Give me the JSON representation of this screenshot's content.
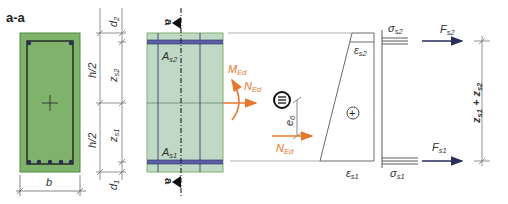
{
  "section_label": "a-a",
  "section_mark": "a",
  "labels": {
    "b": "b",
    "d1": {
      "main": "d",
      "sub": "1"
    },
    "d2": {
      "main": "d",
      "sub": "2"
    },
    "h_half": "h/2",
    "zs1": {
      "main": "z",
      "sub": "s1"
    },
    "zs2": {
      "main": "z",
      "sub": "s2"
    },
    "As1": {
      "main": "A",
      "sub": "s1"
    },
    "As2": {
      "main": "A",
      "sub": "s2"
    },
    "MEd": {
      "main": "M",
      "sub": "Ed"
    },
    "NEd": {
      "main": "N",
      "sub": "Ed"
    },
    "e0": {
      "main": "e",
      "sub": "0"
    },
    "equiv": "≡",
    "es1": {
      "main": "ε",
      "sub": "s1"
    },
    "es2": {
      "main": "ε",
      "sub": "s2"
    },
    "sigma_s1": {
      "main": "σ",
      "sub": "s1"
    },
    "sigma_s2": {
      "main": "σ",
      "sub": "s2"
    },
    "Fs1": {
      "main": "F",
      "sub": "s1"
    },
    "Fs2": {
      "main": "F",
      "sub": "s2"
    },
    "plus": "+",
    "lever_arm": "z",
    "lever_arm_sub1": "s1",
    "lever_arm_plus": " + z",
    "lever_arm_sub2": "s2"
  },
  "colors": {
    "section_fill": "#7fb26b",
    "section_border": "#4f8a3d",
    "elevation_fill": "#bfd9c6",
    "rebar": "#5a5fa8",
    "load": "#e8772e",
    "force_arrow": "#2a2f5a",
    "line": "#444444"
  }
}
